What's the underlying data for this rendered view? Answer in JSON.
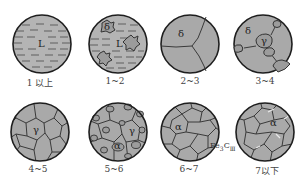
{
  "figure": {
    "panels": [
      {
        "id": "p1",
        "caption": "1 以上",
        "phases": [
          "L"
        ]
      },
      {
        "id": "p2",
        "caption": "1~2",
        "phases": [
          "δ",
          "L"
        ]
      },
      {
        "id": "p3",
        "caption": "2~3",
        "phases": [
          "δ"
        ]
      },
      {
        "id": "p4",
        "caption": "3~4",
        "phases": [
          "δ",
          "γ"
        ]
      },
      {
        "id": "p5",
        "caption": "4~5",
        "phases": [
          "γ"
        ]
      },
      {
        "id": "p6",
        "caption": "5~6",
        "phases": [
          "γ",
          "α"
        ]
      },
      {
        "id": "p7",
        "caption": "6~7",
        "phases": [
          "α"
        ]
      },
      {
        "id": "p8",
        "caption": "7以下",
        "phases": [
          "α"
        ]
      }
    ],
    "annotation": {
      "base": "Fe",
      "sub1": "3",
      "mid": "C",
      "sub2": "Ⅲ"
    },
    "colors": {
      "grain": "#a9a9a9",
      "liquid": "#b4b4b4",
      "boundary": "#3a3a3a",
      "outline": "#1e1e1e",
      "small_grain": "#9c9c9c",
      "cementite": "#e8e8e8"
    }
  }
}
